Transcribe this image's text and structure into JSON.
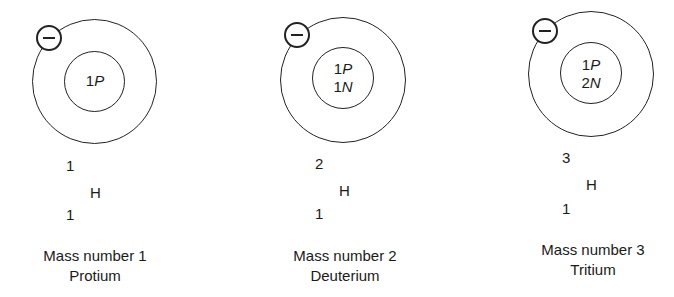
{
  "isotopes": [
    {
      "name": "Protium",
      "caption_mass": "Mass number 1",
      "nucleus": [
        "1P"
      ],
      "nucleus_lines": [
        {
          "count": "1",
          "particle": "P"
        }
      ],
      "mass_number": "1",
      "symbol": "H",
      "atomic_number": "1",
      "electron_icon": "minus-circle"
    },
    {
      "name": "Deuterium",
      "caption_mass": "Mass number 2",
      "nucleus_lines": [
        {
          "count": "1",
          "particle": "P"
        },
        {
          "count": "1",
          "particle": "N"
        }
      ],
      "mass_number": "2",
      "symbol": "H",
      "atomic_number": "1",
      "electron_icon": "minus-circle"
    },
    {
      "name": "Tritium",
      "caption_mass": "Mass number 3",
      "nucleus_lines": [
        {
          "count": "1",
          "particle": "P"
        },
        {
          "count": "2",
          "particle": "N"
        }
      ],
      "mass_number": "3",
      "symbol": "H",
      "atomic_number": "1",
      "electron_icon": "minus-circle"
    }
  ]
}
